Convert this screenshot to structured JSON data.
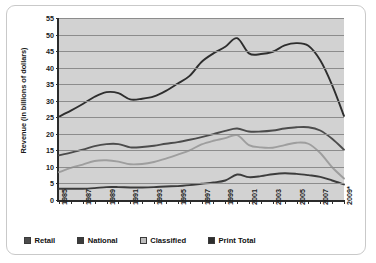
{
  "chart_data": {
    "type": "line",
    "title": "",
    "xlabel": "",
    "ylabel": "Revenue (in billions of dollars)",
    "ylim": [
      0,
      55
    ],
    "yticks": [
      0,
      5,
      10,
      15,
      20,
      25,
      30,
      35,
      40,
      45,
      50,
      55
    ],
    "grid": true,
    "legend_position": "bottom",
    "x": [
      1985,
      1986,
      1987,
      1988,
      1989,
      1990,
      1991,
      1992,
      1993,
      1994,
      1995,
      1996,
      1997,
      1998,
      1999,
      2000,
      2001,
      2002,
      2003,
      2004,
      2005,
      2006,
      2007,
      2008,
      2009
    ],
    "xtick_labels": [
      "1985",
      "1987",
      "1989",
      "1991",
      "1993",
      "1995",
      "1997",
      "1999",
      "2001",
      "2003",
      "2005",
      "2007",
      "2009*"
    ],
    "xtick_values": [
      1985,
      1987,
      1989,
      1991,
      1993,
      1995,
      1997,
      1999,
      2001,
      2003,
      2005,
      2007,
      2009
    ],
    "series": [
      {
        "name": "Print Total",
        "color": "#2e2e2e",
        "values": [
          25.2,
          27.0,
          29.0,
          31.2,
          32.6,
          32.3,
          30.4,
          30.6,
          31.3,
          33.0,
          35.2,
          37.5,
          41.7,
          44.3,
          46.3,
          48.9,
          44.3,
          44.1,
          44.8,
          46.7,
          47.4,
          46.6,
          42.2,
          34.7,
          25.4
        ],
        "marker": "none"
      },
      {
        "name": "Retail",
        "color": "#4c4c4c",
        "values": [
          13.5,
          14.3,
          15.2,
          16.3,
          16.9,
          16.9,
          15.9,
          16.0,
          16.4,
          17.0,
          17.5,
          18.2,
          19.0,
          19.9,
          20.9,
          21.6,
          20.7,
          20.7,
          21.0,
          21.6,
          22.0,
          22.0,
          21.0,
          18.5,
          15.2
        ]
      },
      {
        "name": "Classified",
        "color": "#9e9e9e",
        "values": [
          8.4,
          9.7,
          10.7,
          11.8,
          12.0,
          11.6,
          10.8,
          10.9,
          11.5,
          12.5,
          13.7,
          15.0,
          16.8,
          17.9,
          18.7,
          19.6,
          16.6,
          15.9,
          15.8,
          16.6,
          17.3,
          17.0,
          14.2,
          9.9,
          6.5
        ]
      },
      {
        "name": "National",
        "color": "#3c3c3c",
        "values": [
          3.4,
          3.4,
          3.4,
          3.6,
          3.9,
          3.9,
          3.8,
          3.8,
          3.9,
          4.1,
          4.2,
          4.5,
          4.9,
          5.3,
          5.9,
          7.7,
          6.9,
          7.2,
          7.8,
          8.1,
          7.9,
          7.5,
          7.0,
          5.9,
          4.7
        ]
      }
    ]
  },
  "legend": {
    "items": [
      {
        "label": "Retail",
        "color": "#4c4c4c"
      },
      {
        "label": "National",
        "color": "#3c3c3c"
      },
      {
        "label": "Classified",
        "color": "#bdbdbd"
      },
      {
        "label": "Print Total",
        "color": "#2e2e2e"
      }
    ]
  }
}
